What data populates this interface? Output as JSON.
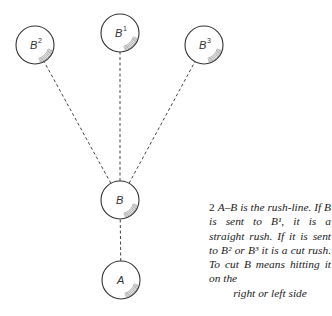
{
  "diagram": {
    "balls": [
      {
        "id": "B2",
        "label": "B",
        "sup": "2",
        "cx": 35,
        "cy": 45,
        "r": 19
      },
      {
        "id": "B1",
        "label": "B",
        "sup": "1",
        "cx": 120,
        "cy": 33,
        "r": 19
      },
      {
        "id": "B3",
        "label": "B",
        "sup": "3",
        "cx": 204,
        "cy": 45,
        "r": 19
      },
      {
        "id": "B",
        "label": "B",
        "sup": "",
        "cx": 120,
        "cy": 200,
        "r": 19
      },
      {
        "id": "A",
        "label": "A",
        "sup": "",
        "cx": 121,
        "cy": 280,
        "r": 19
      }
    ],
    "lines": [
      {
        "from": "A",
        "to": "B"
      },
      {
        "from": "B",
        "to": "B1"
      },
      {
        "from": "B",
        "to": "B2"
      },
      {
        "from": "B",
        "to": "B3"
      }
    ],
    "colors": {
      "stroke": "#333333",
      "dash": "#444444",
      "background": "#ffffff"
    }
  },
  "caption": {
    "number": "2",
    "text": "A–B is the rush-line. If B is sent to B¹, it is a straight rush. If it is sent to B² or B³ it is a cut rush. To cut B means hitting it on the",
    "last_line": "right or left side"
  }
}
